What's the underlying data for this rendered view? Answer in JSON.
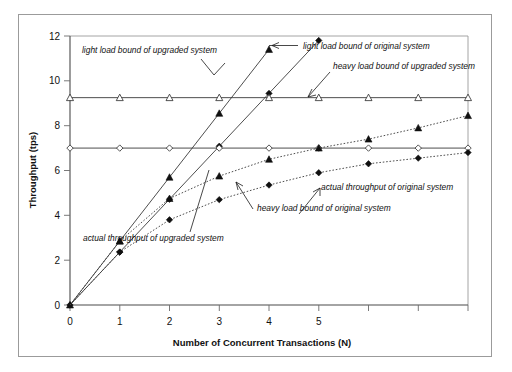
{
  "chart_data": {
    "type": "line",
    "title": "",
    "xlabel": "Number of Concurrent Transactions (N)",
    "ylabel": "Throughput (tps)",
    "xlim": [
      0,
      8
    ],
    "ylim": [
      0,
      12
    ],
    "xticks": [
      0,
      1,
      2,
      3,
      4,
      5,
      6,
      7,
      8
    ],
    "xtick_labels": [
      "0",
      "1",
      "2",
      "3",
      "4",
      "5",
      "",
      "",
      ""
    ],
    "yticks": [
      0,
      2,
      4,
      6,
      8,
      10,
      12
    ],
    "ytick_labels": [
      "0",
      "2",
      "4",
      "6",
      "8",
      "10",
      "12"
    ],
    "grid": false,
    "legend": "none (inline annotations with leader lines)",
    "series": [
      {
        "name": "light load bound of upgraded system",
        "marker": "filled-triangle",
        "linestyle": "solid",
        "x": [
          0,
          1,
          2,
          3,
          4
        ],
        "values": [
          0,
          2.85,
          5.7,
          8.55,
          11.4
        ]
      },
      {
        "name": "light load bound of original system",
        "marker": "filled-diamond",
        "linestyle": "solid",
        "x": [
          0,
          1,
          2,
          3,
          4,
          5
        ],
        "values": [
          0,
          2.36,
          4.72,
          7.08,
          9.44,
          11.8
        ]
      },
      {
        "name": "heavy load bound of upgraded system",
        "marker": "open-triangle",
        "linestyle": "solid",
        "x": [
          0,
          1,
          2,
          3,
          4,
          5,
          6,
          7,
          8
        ],
        "values": [
          9.25,
          9.25,
          9.25,
          9.25,
          9.25,
          9.25,
          9.25,
          9.25,
          9.25
        ]
      },
      {
        "name": "heavy load bound of original system",
        "marker": "open-diamond",
        "linestyle": "solid",
        "x": [
          0,
          1,
          2,
          3,
          4,
          5,
          6,
          7,
          8
        ],
        "values": [
          7.0,
          7.0,
          7.0,
          7.0,
          7.0,
          7.0,
          7.0,
          7.0,
          7.0
        ]
      },
      {
        "name": "actual throughput of upgraded system",
        "marker": "filled-triangle",
        "linestyle": "dotted",
        "x": [
          0,
          1,
          2,
          3,
          4,
          5,
          6,
          7,
          8
        ],
        "values": [
          0,
          2.85,
          4.75,
          5.75,
          6.5,
          7.0,
          7.4,
          7.9,
          8.45
        ]
      },
      {
        "name": "actual throughput of original system",
        "marker": "filled-diamond",
        "linestyle": "dotted",
        "x": [
          0,
          1,
          2,
          3,
          4,
          5,
          6,
          7,
          8
        ],
        "values": [
          0,
          2.36,
          3.8,
          4.7,
          5.35,
          5.9,
          6.3,
          6.55,
          6.8
        ]
      }
    ],
    "annotations": [
      {
        "id": "a1",
        "text": "light load bound of upgraded system"
      },
      {
        "id": "a2",
        "text": "light load bound of original system"
      },
      {
        "id": "a3",
        "text": "heavy load bound of upgraded system"
      },
      {
        "id": "a4",
        "text": "actual throughput of original system"
      },
      {
        "id": "a5",
        "text": "heavy load bound of original system"
      },
      {
        "id": "a6",
        "text": "actual throughput of upgraded system"
      }
    ]
  },
  "axes": {
    "x_title": "Number of Concurrent Transactions (N)",
    "y_title": "Throughput (tps)",
    "x_labels": [
      "0",
      "1",
      "2",
      "3",
      "4",
      "5"
    ],
    "y_labels": [
      "0",
      "2",
      "4",
      "6",
      "8",
      "10",
      "12"
    ]
  },
  "colors": {
    "background": "#ffffff",
    "frame": "#9b9b9b",
    "axis": "#4a4a4a",
    "series": "#2a2a2a",
    "text": "#111111"
  }
}
